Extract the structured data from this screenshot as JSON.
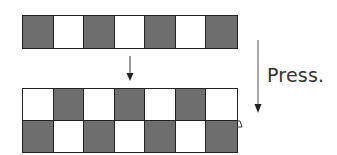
{
  "diagram": {
    "label": "Press.",
    "colors": {
      "dark": "#6e6e6e",
      "light": "#ffffff",
      "stroke": "#222222"
    },
    "top_strip": {
      "rows": 1,
      "cols": 7,
      "pattern": [
        [
          "dark",
          "light",
          "dark",
          "light",
          "dark",
          "light",
          "dark"
        ]
      ]
    },
    "bottom_strip": {
      "rows": 2,
      "cols": 7,
      "pattern": [
        [
          "light",
          "dark",
          "light",
          "dark",
          "light",
          "dark",
          "light"
        ],
        [
          "dark",
          "light",
          "dark",
          "light",
          "dark",
          "light",
          "dark"
        ]
      ]
    },
    "arrows": [
      {
        "name": "small-down-arrow",
        "x": 130,
        "y1": 56,
        "y2": 80
      },
      {
        "name": "press-down-arrow",
        "x": 258,
        "y1": 40,
        "y2": 113
      }
    ]
  }
}
